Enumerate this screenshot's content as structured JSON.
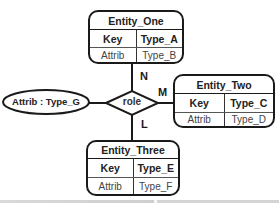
{
  "diagram": {
    "type": "entity-relationship",
    "relationship": {
      "label": "role",
      "shape": "diamond"
    },
    "attribute": {
      "label": "Attrib : Type_G",
      "shape": "ellipse"
    },
    "entities": [
      {
        "name": "Entity_One",
        "rows": [
          {
            "left": "Key",
            "right": "Type_A"
          },
          {
            "left": "Attrib",
            "right": "Type_B"
          }
        ],
        "cardinality": "N"
      },
      {
        "name": "Entity_Two",
        "rows": [
          {
            "left": "Key",
            "right": "Type_C"
          },
          {
            "left": "Attrib",
            "right": "Type_D"
          }
        ],
        "cardinality": "M"
      },
      {
        "name": "Entity_Three",
        "rows": [
          {
            "left": "Key",
            "right": "Type_E"
          },
          {
            "left": "Attrib",
            "right": "Type_F"
          }
        ],
        "cardinality": "L"
      }
    ],
    "colors": {
      "stroke": "#1a1a1a",
      "background": "#ffffff",
      "text": "#222222"
    }
  }
}
